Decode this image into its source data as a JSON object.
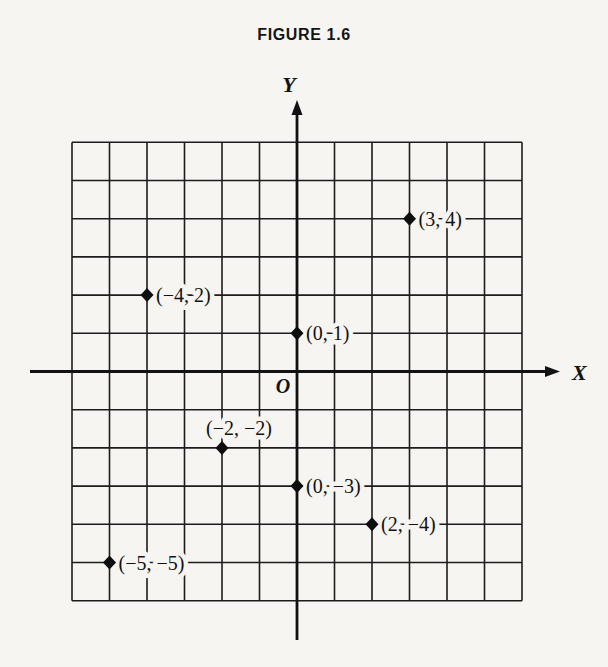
{
  "title": "FIGURE 1.6",
  "colors": {
    "paper": "#f6f5f1",
    "ink": "#141414"
  },
  "chart_data": {
    "type": "scatter",
    "title": "FIGURE 1.6",
    "xlabel": "X",
    "ylabel": "Y",
    "origin_label": "O",
    "xlim": [
      -6,
      6
    ],
    "ylim": [
      -6,
      6
    ],
    "grid": true,
    "grid_step": 1,
    "marker": "diamond",
    "legend": "none",
    "points": [
      {
        "x": 3,
        "y": 4,
        "label": "(3, 4)",
        "label_side": "right"
      },
      {
        "x": -4,
        "y": 2,
        "label": "(−4, 2)",
        "label_side": "right"
      },
      {
        "x": 0,
        "y": 1,
        "label": "(0, 1)",
        "label_side": "right"
      },
      {
        "x": -2,
        "y": -2,
        "label": "(−2, −2)",
        "label_side": "above"
      },
      {
        "x": 0,
        "y": -3,
        "label": "(0, −3)",
        "label_side": "right"
      },
      {
        "x": 2,
        "y": -4,
        "label": "(2, −4)",
        "label_side": "right"
      },
      {
        "x": -5,
        "y": -5,
        "label": "(−5, −5)",
        "label_side": "right"
      }
    ]
  }
}
